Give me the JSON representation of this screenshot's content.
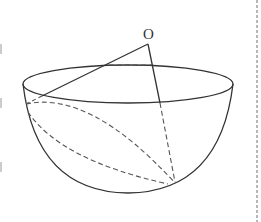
{
  "figure": {
    "type": "geometry-diagram",
    "labels": {
      "point_o": "O"
    },
    "colors": {
      "stroke": "#333333",
      "dashed": "#555555",
      "border_dashed": "#888888",
      "background": "#ffffff"
    }
  }
}
